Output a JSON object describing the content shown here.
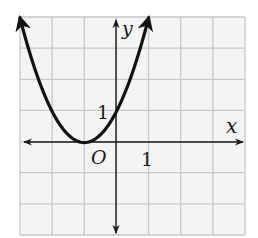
{
  "chart_data": {
    "type": "line",
    "title": "",
    "xlabel": "x",
    "ylabel": "y",
    "origin_label": "O",
    "x_tick_label": "1",
    "y_tick_label": "1",
    "xlim": [
      -3,
      4
    ],
    "ylim": [
      -3,
      4
    ],
    "grid": true,
    "legend": "none",
    "series": [
      {
        "name": "parabola",
        "equation": "y = (x + 1)^2",
        "vertex": [
          -1,
          0
        ],
        "x": [
          -3.0,
          -2.5,
          -2.0,
          -1.5,
          -1.0,
          -0.5,
          0.0,
          0.5,
          1.0
        ],
        "values": [
          4.0,
          2.25,
          1.0,
          0.25,
          0.0,
          0.25,
          1.0,
          2.25,
          4.0
        ],
        "arrows_both_ends": true
      }
    ]
  },
  "colors": {
    "grid": "#c8c8c8",
    "grid_bg": "#f4f4f4",
    "axis": "#1a1a1a",
    "curve": "#111111"
  }
}
